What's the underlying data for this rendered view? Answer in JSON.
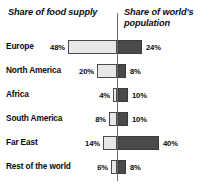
{
  "headers": {
    "left": "Share of food supply",
    "right": "Share of world's population"
  },
  "chart_data": {
    "type": "bar",
    "subtype": "diverging-horizontal-bar",
    "title": "",
    "xlabel": "",
    "ylabel": "",
    "categories": [
      "Europe",
      "North America",
      "Africa",
      "South America",
      "Far East",
      "Rest of the world"
    ],
    "series": [
      {
        "name": "Share of food supply",
        "side": "left",
        "color": "#e8e8e8",
        "unit": "%",
        "values": [
          48,
          20,
          4,
          8,
          14,
          6
        ],
        "labels": [
          "48%",
          "20%",
          "4%",
          "8%",
          "14%",
          "6%"
        ]
      },
      {
        "name": "Share of world's population",
        "side": "right",
        "color": "#4a4a4a",
        "unit": "%",
        "values": [
          24,
          8,
          10,
          10,
          40,
          8
        ],
        "labels": [
          "24%",
          "8%",
          "10%",
          "10%",
          "40%",
          "8%"
        ]
      }
    ],
    "axis": {
      "center_value": 0,
      "grid": false,
      "left_max": 48,
      "right_max": 40,
      "units": "percent"
    },
    "legend": {
      "position": "top",
      "entries": [
        "Share of food supply",
        "Share of world's population"
      ]
    }
  },
  "rows": [
    {
      "region": "Europe",
      "left_label": "48%",
      "right_label": "24%",
      "left_value": 48,
      "right_value": 24
    },
    {
      "region": "North America",
      "left_label": "20%",
      "right_label": "8%",
      "left_value": 20,
      "right_value": 8
    },
    {
      "region": "Africa",
      "left_label": "4%",
      "right_label": "10%",
      "left_value": 4,
      "right_value": 10
    },
    {
      "region": "South America",
      "left_label": "8%",
      "right_label": "10%",
      "left_value": 8,
      "right_value": 10
    },
    {
      "region": "Far East",
      "left_label": "14%",
      "right_label": "40%",
      "left_value": 14,
      "right_value": 40
    },
    {
      "region": "Rest of the world",
      "left_label": "6%",
      "right_label": "8%",
      "left_value": 6,
      "right_value": 8
    }
  ],
  "colors": {
    "left_bar_fill": "#e8e8e8",
    "left_bar_border": "#4a4a4a",
    "right_bar_fill": "#4a4a4a",
    "axis": "#6e6e6e",
    "text": "#0a0a0a",
    "background": "#ffffff"
  },
  "layout": {
    "axis_x": 117,
    "bar_height": 14,
    "px_per_percent": 1.02,
    "row_tops": [
      38,
      62,
      86,
      110,
      134,
      158
    ]
  }
}
